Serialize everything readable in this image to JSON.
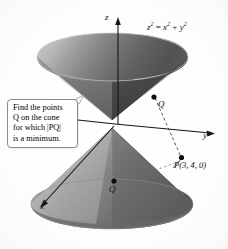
{
  "figure": {
    "caption_bleed": "Figure 5  A typical example",
    "equation": {
      "base1": "z",
      "exp1": "2",
      "eq": " = ",
      "base2": "x",
      "exp2": "2",
      "plus": " + ",
      "base3": "y",
      "exp3": "2"
    },
    "equation_text": "z² = x² + y²",
    "axes": [
      {
        "name": "z-axis",
        "label": "z"
      },
      {
        "name": "y-axis",
        "label": "y"
      },
      {
        "name": "x-axis",
        "label": "x"
      }
    ],
    "callout": {
      "line1": "Find the points",
      "line2": "Q on the cone",
      "line3": "for which |PQ|",
      "line4": "is a minimum."
    },
    "points": [
      {
        "name": "Q-upper",
        "label": "Q"
      },
      {
        "name": "Q-lower",
        "label": "Q"
      },
      {
        "name": "P",
        "label": "P(3, 4, 0)"
      }
    ],
    "colors": {
      "surface_light": "#e6e6e6",
      "surface_mid": "#9a9a9a",
      "surface_dark": "#4a4a4a",
      "axis": "#1a1a1a",
      "callout_border": "#8a8a8a",
      "background": "#ffffff"
    }
  }
}
